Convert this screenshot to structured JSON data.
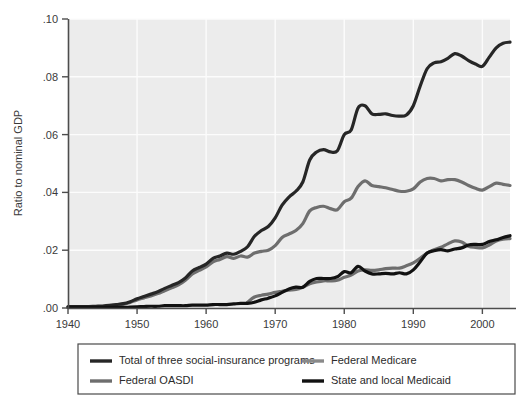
{
  "chart_data": {
    "type": "line",
    "title": "",
    "subtitle": "",
    "xlabel": "",
    "ylabel": "Ratio to nominal GDP",
    "xlim": [
      1940,
      2004
    ],
    "ylim": [
      0.0,
      0.1
    ],
    "grid": true,
    "grid_color": "#fcfcfc",
    "plot_background": "#ececec",
    "legend_position": "below-plot",
    "x_tick_labels": [
      "1940",
      "1950",
      "1960",
      "1970",
      "1980",
      "1990",
      "2000"
    ],
    "x_ticks": [
      1940,
      1950,
      1960,
      1970,
      1980,
      1990,
      2000
    ],
    "y_tick_labels": [
      ".00",
      ".02",
      ".04",
      ".06",
      ".08",
      ".10"
    ],
    "y_ticks": [
      0.0,
      0.02,
      0.04,
      0.06,
      0.08,
      0.1
    ],
    "x": [
      1940,
      1941,
      1942,
      1943,
      1944,
      1945,
      1946,
      1947,
      1948,
      1949,
      1950,
      1951,
      1952,
      1953,
      1954,
      1955,
      1956,
      1957,
      1958,
      1959,
      1960,
      1961,
      1962,
      1963,
      1964,
      1965,
      1966,
      1967,
      1968,
      1969,
      1970,
      1971,
      1972,
      1973,
      1974,
      1975,
      1976,
      1977,
      1978,
      1979,
      1980,
      1981,
      1982,
      1983,
      1984,
      1985,
      1986,
      1987,
      1988,
      1989,
      1990,
      1991,
      1992,
      1993,
      1994,
      1995,
      1996,
      1997,
      1998,
      1999,
      2000,
      2001,
      2002,
      2003,
      2004
    ],
    "series": [
      {
        "name": "Total of three social-insurance programs",
        "color": "#262626",
        "width": 3.2,
        "values": [
          0.0005,
          0.0005,
          0.0005,
          0.0005,
          0.0006,
          0.0007,
          0.0009,
          0.0012,
          0.0015,
          0.0022,
          0.0032,
          0.004,
          0.0048,
          0.0056,
          0.0068,
          0.0078,
          0.0088,
          0.0104,
          0.0128,
          0.014,
          0.0152,
          0.0172,
          0.018,
          0.019,
          0.0186,
          0.0196,
          0.0212,
          0.0248,
          0.0268,
          0.0282,
          0.0312,
          0.0356,
          0.0384,
          0.0404,
          0.0436,
          0.0512,
          0.054,
          0.0548,
          0.054,
          0.0544,
          0.06,
          0.0616,
          0.0692,
          0.07,
          0.0672,
          0.067,
          0.0672,
          0.0666,
          0.0664,
          0.0668,
          0.07,
          0.0768,
          0.0828,
          0.0848,
          0.0852,
          0.0864,
          0.088,
          0.0872,
          0.0856,
          0.0844,
          0.0836,
          0.0868,
          0.09,
          0.0916,
          0.092
        ]
      },
      {
        "name": "Federal OASDI",
        "color": "#6e6e6e",
        "width": 3.2,
        "values": [
          0.0003,
          0.0003,
          0.0003,
          0.0003,
          0.0004,
          0.0005,
          0.0007,
          0.001,
          0.0013,
          0.0019,
          0.0028,
          0.0035,
          0.0042,
          0.005,
          0.006,
          0.007,
          0.008,
          0.0096,
          0.0118,
          0.013,
          0.0142,
          0.016,
          0.0168,
          0.0178,
          0.0172,
          0.018,
          0.0176,
          0.019,
          0.0196,
          0.02,
          0.0216,
          0.0244,
          0.0256,
          0.0268,
          0.0292,
          0.0336,
          0.0348,
          0.0352,
          0.0344,
          0.034,
          0.0368,
          0.038,
          0.042,
          0.044,
          0.0424,
          0.042,
          0.0416,
          0.041,
          0.0404,
          0.0404,
          0.0412,
          0.0436,
          0.0448,
          0.0448,
          0.044,
          0.0444,
          0.0444,
          0.0436,
          0.0424,
          0.0414,
          0.0408,
          0.042,
          0.0432,
          0.0428,
          0.0424
        ]
      },
      {
        "name": "Federal Medicare",
        "color": "#6e6e6e",
        "width": 3.2,
        "values": [
          0.0,
          0.0,
          0.0,
          0.0,
          0.0,
          0.0,
          0.0,
          0.0,
          0.0,
          0.0,
          0.0,
          0.0,
          0.0,
          0.0,
          0.0,
          0.0,
          0.0,
          0.0,
          0.0,
          0.0,
          0.0,
          0.0,
          0.0,
          0.0,
          0.0,
          0.0,
          0.002,
          0.0038,
          0.0044,
          0.0048,
          0.0054,
          0.0058,
          0.0062,
          0.0064,
          0.0072,
          0.0084,
          0.009,
          0.0094,
          0.0094,
          0.0096,
          0.0106,
          0.0114,
          0.0128,
          0.0132,
          0.013,
          0.0132,
          0.0136,
          0.0138,
          0.0138,
          0.0146,
          0.0156,
          0.0172,
          0.019,
          0.0202,
          0.021,
          0.0222,
          0.0232,
          0.0228,
          0.0214,
          0.021,
          0.0208,
          0.0218,
          0.0232,
          0.0238,
          0.024
        ]
      },
      {
        "name": "State and local Medicaid",
        "color": "#111111",
        "width": 3.2,
        "values": [
          0.0002,
          0.0002,
          0.0002,
          0.0002,
          0.0002,
          0.0002,
          0.0002,
          0.0002,
          0.0002,
          0.0003,
          0.0004,
          0.0005,
          0.0006,
          0.0006,
          0.0008,
          0.0008,
          0.0008,
          0.0008,
          0.001,
          0.001,
          0.001,
          0.0012,
          0.0012,
          0.0012,
          0.0014,
          0.0016,
          0.0016,
          0.002,
          0.0028,
          0.0034,
          0.0042,
          0.0054,
          0.0066,
          0.0072,
          0.0072,
          0.0092,
          0.0102,
          0.0102,
          0.0102,
          0.0108,
          0.0126,
          0.0122,
          0.0144,
          0.0128,
          0.0118,
          0.0118,
          0.012,
          0.0118,
          0.0122,
          0.0118,
          0.0132,
          0.016,
          0.019,
          0.0198,
          0.0202,
          0.0198,
          0.0204,
          0.0208,
          0.0218,
          0.022,
          0.022,
          0.023,
          0.0236,
          0.0244,
          0.025
        ]
      }
    ],
    "legend_entries": [
      {
        "label": "Total of three social-insurance programs",
        "color": "#262626",
        "column": 0,
        "row": 0
      },
      {
        "label": "Federal OASDI",
        "color": "#6e6e6e",
        "column": 0,
        "row": 1
      },
      {
        "label": "Federal Medicare",
        "color": "#8a8a8a",
        "column": 1,
        "row": 0
      },
      {
        "label": "State and local Medicaid",
        "color": "#111111",
        "column": 1,
        "row": 1
      }
    ]
  }
}
